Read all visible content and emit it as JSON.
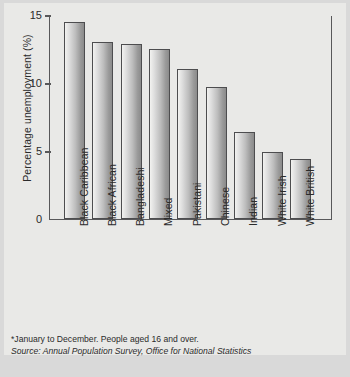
{
  "chart_data": {
    "type": "bar",
    "title": "",
    "xlabel": "",
    "ylabel": "Percentage unemployment (%)",
    "categories": [
      "Black Caribbean",
      "Black African",
      "Bangladeshi",
      "Mixed",
      "Pakistani",
      "Chinese",
      "Indian",
      "White Irish",
      "White British"
    ],
    "values": [
      14.5,
      13.0,
      12.9,
      12.5,
      11.0,
      9.7,
      6.4,
      4.9,
      4.4
    ],
    "ylim": [
      0,
      15
    ],
    "yticks": [
      0,
      5,
      10,
      15
    ],
    "ytick_labels": [
      "0",
      "5",
      "10",
      "15"
    ],
    "grid": false,
    "legend": false,
    "bar_color": "#bdbdbd",
    "bar_border_color": "#4d4d4f",
    "axis_color": "#58585a",
    "background_color": "#e9e9e7"
  },
  "footnotes": {
    "note": "*January to December. People aged 16 and over.",
    "source": "Source: Annual Population Survey, Office for National Statistics"
  }
}
